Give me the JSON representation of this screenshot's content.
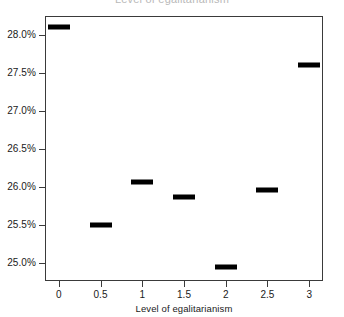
{
  "chart_data": {
    "type": "scatter",
    "title": "",
    "xlabel": "Level of egalitarianism",
    "ylabel": "",
    "x": [
      0,
      0.5,
      1,
      1.5,
      2,
      2.5,
      3
    ],
    "values": [
      28.1,
      25.5,
      26.07,
      25.87,
      24.95,
      25.96,
      27.6
    ],
    "xticklabels": [
      "0",
      "0.5",
      "1",
      "1.5",
      "2",
      "2.5",
      "3"
    ],
    "xticks": [
      0,
      0.5,
      1,
      1.5,
      2,
      2.5,
      3
    ],
    "yticklabels": [
      "25.0%",
      "25.5%",
      "26.0%",
      "26.5%",
      "27.0%",
      "27.5%",
      "28.0%"
    ],
    "yticks": [
      25.0,
      25.5,
      26.0,
      26.5,
      27.0,
      27.5,
      28.0
    ],
    "xlim": [
      -0.165,
      3.165
    ],
    "ylim": [
      24.77,
      28.25
    ],
    "grid": false,
    "legend": null,
    "marker_style": "horizontal-bar",
    "marker_color": "#000000",
    "frame_color": "#3a3a3a"
  },
  "title_sliver": "Level of egalitarianism"
}
